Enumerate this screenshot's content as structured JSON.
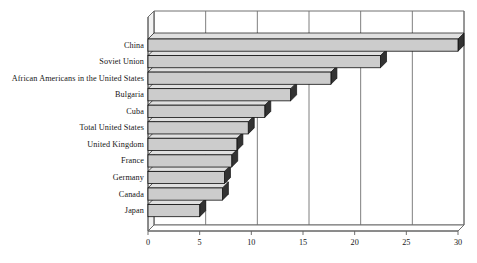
{
  "chart_data": {
    "type": "bar",
    "orientation": "horizontal",
    "style": "3d-bar",
    "title": "",
    "subtitle": "",
    "xlabel": "",
    "ylabel": "",
    "xlim": [
      0,
      30
    ],
    "xticks": [
      0,
      5,
      10,
      15,
      20,
      25,
      30
    ],
    "xtick_labels": [
      "0",
      "5",
      "10",
      "15",
      "20",
      "25",
      "30"
    ],
    "grid": true,
    "grid_axis": "x",
    "legend": false,
    "legend_position": "none",
    "categories": [
      "China",
      "Soviet Union",
      "African Americans in the United States",
      "Bulgaria",
      "Cuba",
      "Total United States",
      "United Kingdom",
      "France",
      "Germany",
      "Canada",
      "Japan"
    ],
    "values": [
      30,
      22.5,
      17.7,
      13.8,
      11.3,
      9.7,
      8.6,
      8.1,
      7.4,
      7.2,
      5.0
    ],
    "series": [
      {
        "name": "",
        "values": [
          30,
          22.5,
          17.7,
          13.8,
          11.3,
          9.7,
          8.6,
          8.1,
          7.4,
          7.2,
          5.0
        ]
      }
    ],
    "colors": {
      "bar_face": "#cccccc",
      "bar_top": "#e0e0e0",
      "bar_side": "#333333",
      "bar_outline": "#101010",
      "plot_background": "#ffffff",
      "axis_line": "#606060",
      "grid_line": "#707070",
      "text": "#161616"
    }
  },
  "axis": {
    "x_ticks": [
      "0",
      "5",
      "10",
      "15",
      "20",
      "25",
      "30"
    ]
  },
  "labels": {
    "items": [
      "China",
      "Soviet Union",
      "African Americans in the United States",
      "Bulgaria",
      "Cuba",
      "Total United States",
      "United Kingdom",
      "France",
      "Germany",
      "Canada",
      "Japan"
    ]
  }
}
